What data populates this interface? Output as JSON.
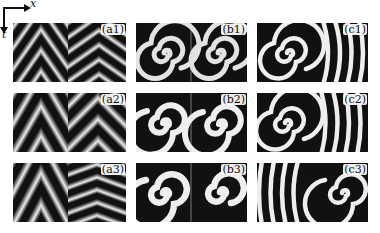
{
  "figure": {
    "axes": {
      "x_label": "x",
      "t_label": "t"
    },
    "panels": [
      {
        "id": "a1",
        "label": "(a1)",
        "type": "chevron-stripes",
        "row": 1,
        "col": "a"
      },
      {
        "id": "b1",
        "label": "(b1)",
        "type": "spiral-pair",
        "row": 1,
        "col": "b"
      },
      {
        "id": "c1",
        "label": "(c1)",
        "type": "spiral-with-plane-waves",
        "row": 1,
        "col": "c"
      },
      {
        "id": "a2",
        "label": "(a2)",
        "type": "chevron-stripes",
        "row": 2,
        "col": "a"
      },
      {
        "id": "b2",
        "label": "(b2)",
        "type": "spiral-pair",
        "row": 2,
        "col": "b"
      },
      {
        "id": "c2",
        "label": "(c2)",
        "type": "spiral-with-plane-waves",
        "row": 2,
        "col": "c"
      },
      {
        "id": "a3",
        "label": "(a3)",
        "type": "chevron-stripes",
        "row": 3,
        "col": "a"
      },
      {
        "id": "b3",
        "label": "(b3)",
        "type": "spiral-pair",
        "row": 3,
        "col": "b"
      },
      {
        "id": "c3",
        "label": "(c3)",
        "type": "plane-waves-with-spiral",
        "row": 3,
        "col": "c"
      }
    ],
    "colormap": {
      "dark": "#111111",
      "light": "#f2f2f2"
    }
  }
}
